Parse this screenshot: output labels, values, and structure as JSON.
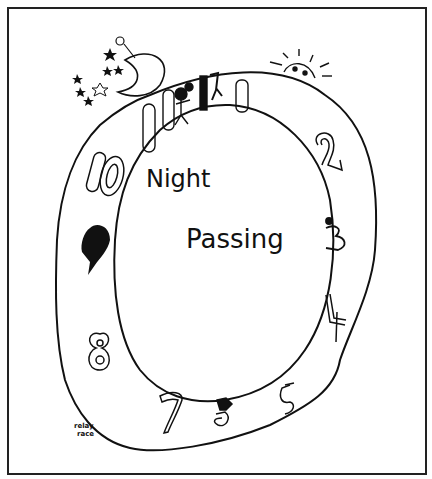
{
  "illustration": {
    "title_line1": "Night",
    "title_line2": "Passing",
    "caption_line1": "relay",
    "caption_line2": "race",
    "numerals": {
      "n1": "1",
      "n2": "2",
      "n3": "3",
      "n4": "4",
      "n5": "5",
      "n7": "7",
      "n8": "8",
      "n10": "10"
    },
    "decorations": [
      "moon",
      "stars",
      "sun",
      "runner-figures"
    ],
    "colors": {
      "ink": "#111111",
      "paper": "#ffffff",
      "frame": "#222222"
    }
  }
}
